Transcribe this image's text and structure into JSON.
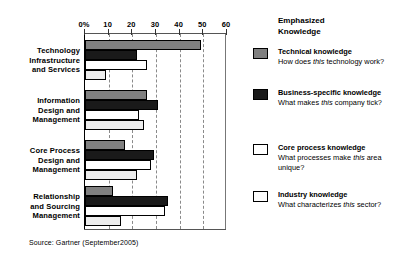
{
  "source_note": "Source: Gartner (September2005)",
  "legend": {
    "title_line1": "Emphasized",
    "title_line2": "Knowledge",
    "entries": [
      {
        "name": "Technical knowledge",
        "question_pre": "How does ",
        "question_em": "this",
        "question_post": " technology work?",
        "color": "#808080"
      },
      {
        "name": "Business-specific knowledge",
        "question_pre": "What makes ",
        "question_em": "this",
        "question_post": " company tick?",
        "color": "#1a1a1a"
      },
      {
        "name": "Core process knowledge",
        "question_pre": "What processes make ",
        "question_em": "this",
        "question_post": " area unique?",
        "color": "#ffffff"
      },
      {
        "name": "Industry knowledge",
        "question_pre": "What characterizes ",
        "question_em": "this",
        "question_post": " sector?",
        "color": "#fcfcfc"
      }
    ]
  },
  "chart_data": {
    "type": "bar",
    "orientation": "horizontal",
    "title": "",
    "xlabel": "",
    "ylabel": "",
    "xlim": [
      0,
      60
    ],
    "xticks": [
      0,
      10,
      20,
      30,
      40,
      50,
      60
    ],
    "xtick_labels": [
      "0%",
      "10",
      "20",
      "30",
      "40",
      "50",
      "60"
    ],
    "grid": "vertical-dashed",
    "legend_position": "right",
    "categories": [
      "Technology Infrastructure and Services",
      "Information Design and Management",
      "Core Process Design and Management",
      "Relationship and Sourcing Management"
    ],
    "category_lines": [
      [
        "Technology",
        "Infrastructure",
        "and Services"
      ],
      [
        "Information",
        "Design and",
        "Management"
      ],
      [
        "Core Process",
        "Design and",
        "Management"
      ],
      [
        "Relationship",
        "and Sourcing",
        "Management"
      ]
    ],
    "series": [
      {
        "name": "Technical knowledge",
        "color": "#808080",
        "values": [
          49,
          26,
          17,
          12
        ]
      },
      {
        "name": "Business-specific knowledge",
        "color": "#1a1a1a",
        "values": [
          22,
          31,
          29,
          35
        ]
      },
      {
        "name": "Core process knowledge",
        "color": "#ffffff",
        "values": [
          26,
          23,
          28,
          34
        ]
      },
      {
        "name": "Industry knowledge",
        "color": "#ededed",
        "values": [
          9,
          25,
          22,
          15
        ]
      }
    ]
  }
}
